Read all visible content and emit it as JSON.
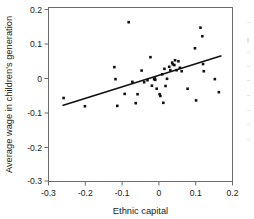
{
  "figure": {
    "kind": "scatter-plot-with-fit-line",
    "background": "#ffffff",
    "marker_color": "#111111",
    "line_color": "#111111",
    "frame_color": "#6b6b6b"
  },
  "axes": {
    "x": {
      "label": "Ethnic capital",
      "ticks": [
        "-0.3",
        "-0.2",
        "-0.1",
        "0",
        "0.1",
        "0.2"
      ],
      "tick_values": [
        -0.3,
        -0.2,
        -0.1,
        0,
        0.1,
        0.2
      ],
      "min": -0.3,
      "max": 0.2
    },
    "y": {
      "label": "Average wage in children's generation",
      "ticks": [
        "0.2",
        "0.1",
        "0",
        "-0.1",
        "-0.2",
        "-0.3"
      ],
      "tick_values": [
        0.2,
        0.1,
        0,
        -0.1,
        -0.2,
        -0.3
      ],
      "min": -0.3,
      "max": 0.2
    }
  },
  "chart_data": {
    "type": "scatter",
    "title": "",
    "xlabel": "Ethnic capital",
    "ylabel": "Average wage in children's generation",
    "xlim": [
      -0.3,
      0.2
    ],
    "ylim": [
      -0.3,
      0.2
    ],
    "grid": false,
    "legend": null,
    "marker": "square",
    "series": [
      {
        "name": "observations",
        "points": [
          [
            -0.259,
            -0.058
          ],
          [
            -0.201,
            -0.082
          ],
          [
            -0.121,
            0.032
          ],
          [
            -0.118,
            -0.003
          ],
          [
            -0.113,
            -0.081
          ],
          [
            -0.093,
            -0.046
          ],
          [
            -0.082,
            0.163
          ],
          [
            -0.072,
            -0.011
          ],
          [
            -0.063,
            -0.073
          ],
          [
            -0.058,
            -0.047
          ],
          [
            -0.047,
            0.022
          ],
          [
            -0.04,
            -0.012
          ],
          [
            -0.031,
            -0.006
          ],
          [
            -0.023,
            0.061
          ],
          [
            -0.019,
            -0.022
          ],
          [
            -0.013,
            -0.003
          ],
          [
            -0.011,
            -0.001
          ],
          [
            -0.01,
            -0.005
          ],
          [
            -0.006,
            -0.031
          ],
          [
            0.002,
            -0.047
          ],
          [
            0.004,
            -0.052
          ],
          [
            0.009,
            0.011
          ],
          [
            0.012,
            -0.072
          ],
          [
            0.015,
            0.027
          ],
          [
            0.018,
            -0.023
          ],
          [
            0.022,
            -0.002
          ],
          [
            0.028,
            0.033
          ],
          [
            0.031,
            0.023
          ],
          [
            0.036,
            0.045
          ],
          [
            0.038,
            0.04
          ],
          [
            0.042,
            0.038
          ],
          [
            0.044,
            0.052
          ],
          [
            0.048,
            0.023
          ],
          [
            0.053,
            0.049
          ],
          [
            0.057,
            0.03
          ],
          [
            0.062,
            0.02
          ],
          [
            0.078,
            -0.031
          ],
          [
            0.098,
            0.087
          ],
          [
            0.101,
            -0.065
          ],
          [
            0.113,
            0.147
          ],
          [
            0.118,
            0.122
          ],
          [
            0.12,
            0.041
          ],
          [
            0.122,
            0.02
          ],
          [
            0.152,
            -0.003
          ],
          [
            0.163,
            -0.041
          ]
        ]
      }
    ],
    "fit_line": {
      "name": "linear fit",
      "x_start": -0.262,
      "y_start": -0.08,
      "x_end": 0.17,
      "y_end": 0.065
    }
  }
}
